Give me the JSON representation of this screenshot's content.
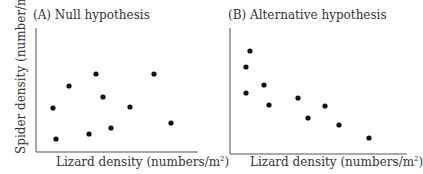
{
  "chart_data": [
    {
      "type": "scatter",
      "title": "(A)  Null hypothesis",
      "xlabel": "Lizard density (numbers/m²)",
      "ylabel": "Spider density (number/m²)",
      "grid": false,
      "ticks": false,
      "axes_px": {
        "x0": 36,
        "y0": 152,
        "x1": 198,
        "y1": 28
      },
      "points": [
        {
          "x": 53,
          "y": 108
        },
        {
          "x": 69,
          "y": 86
        },
        {
          "x": 96,
          "y": 74
        },
        {
          "x": 103,
          "y": 97
        },
        {
          "x": 130,
          "y": 107
        },
        {
          "x": 154,
          "y": 74
        },
        {
          "x": 171,
          "y": 123
        },
        {
          "x": 56,
          "y": 139
        },
        {
          "x": 89,
          "y": 134
        },
        {
          "x": 111,
          "y": 128
        }
      ],
      "relationship": "no correlation"
    },
    {
      "type": "scatter",
      "title": "(B)  Alternative hypothesis",
      "xlabel": "Lizard density (numbers/m²)",
      "ylabel": "",
      "grid": false,
      "ticks": false,
      "axes_px": {
        "x0": 230,
        "y0": 154,
        "x1": 407,
        "y1": 28
      },
      "points": [
        {
          "x": 250,
          "y": 51
        },
        {
          "x": 246,
          "y": 67
        },
        {
          "x": 246,
          "y": 93
        },
        {
          "x": 264,
          "y": 85
        },
        {
          "x": 269,
          "y": 105
        },
        {
          "x": 298,
          "y": 98
        },
        {
          "x": 308,
          "y": 118
        },
        {
          "x": 325,
          "y": 106
        },
        {
          "x": 339,
          "y": 125
        },
        {
          "x": 369,
          "y": 138
        }
      ],
      "relationship": "negative correlation"
    }
  ],
  "panelA": {
    "title": "(A)  Null hypothesis",
    "xlabel_main": "Lizard density (numbers/m",
    "ylabel_main": "Spider density (number/m",
    "sup": "2",
    "close": ")"
  },
  "panelB": {
    "title": "(B)  Alternative hypothesis",
    "xlabel_main": "Lizard density (numbers/m",
    "sup": "2",
    "close": ")"
  },
  "colors": {
    "axis": "#555555",
    "point": "#111111",
    "text": "#333333"
  }
}
